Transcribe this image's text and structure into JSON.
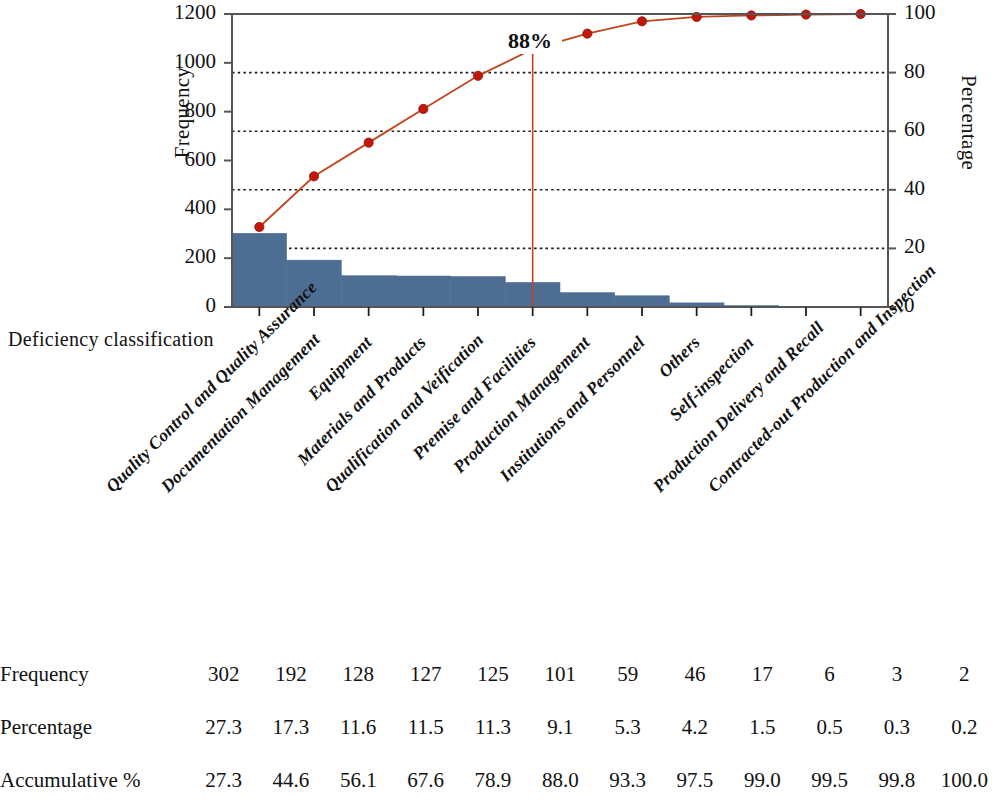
{
  "chart_data": {
    "type": "bar",
    "title": "",
    "subtitle": "",
    "xlabel": "Deficiency classification",
    "ylabel": "Frequency",
    "y2label": "Percentage",
    "ylim": [
      0,
      1200
    ],
    "y2lim": [
      0,
      100
    ],
    "yticks": [
      "0",
      "200",
      "400",
      "600",
      "800",
      "1000",
      "1200"
    ],
    "ytick_values": [
      0,
      200,
      400,
      600,
      800,
      1000,
      1200
    ],
    "y2ticks": [
      "0",
      "20",
      "40",
      "60",
      "80",
      "100"
    ],
    "y2tick_values": [
      0,
      20,
      40,
      60,
      80,
      100
    ],
    "grid": "horizontal-dotted-on-right-axis",
    "legend": "none",
    "categories": [
      "Quality Control and Quality Assurance",
      "Documentation Management",
      "Equipment",
      "Materials and Products",
      "Qualification and Veification",
      "Premise and Facilities",
      "Production Management",
      "Institutions and Personnel",
      "Others",
      "Self-inspection",
      "Production Delivery and Recall",
      "Contracted-out Production and Inspection"
    ],
    "series": [
      {
        "name": "Frequency",
        "type": "bar",
        "axis": "left",
        "color": "#4d6d93",
        "values": [
          302,
          192,
          128,
          127,
          125,
          101,
          59,
          46,
          17,
          6,
          3,
          2
        ]
      },
      {
        "name": "Accumulative %",
        "type": "line",
        "axis": "right",
        "color": "#c0451f",
        "marker_color": "#c4170c",
        "values": [
          27.3,
          44.6,
          56.1,
          67.6,
          78.9,
          88.0,
          93.3,
          97.5,
          99.0,
          99.5,
          99.8,
          100.0
        ]
      }
    ],
    "annotations": [
      {
        "text": "88%",
        "category": "Premise and Facilities",
        "category_index": 5,
        "value": 88.0,
        "marker": "vertical-line"
      }
    ]
  },
  "table": {
    "rows": [
      {
        "label": "Frequency",
        "values": [
          "302",
          "192",
          "128",
          "127",
          "125",
          "101",
          "59",
          "46",
          "17",
          "6",
          "3",
          "2"
        ]
      },
      {
        "label": "Percentage",
        "values": [
          "27.3",
          "17.3",
          "11.6",
          "11.5",
          "11.3",
          "9.1",
          "5.3",
          "4.2",
          "1.5",
          "0.5",
          "0.3",
          "0.2"
        ]
      },
      {
        "label": "Accumulative %",
        "values": [
          "27.3",
          "44.6",
          "56.1",
          "67.6",
          "78.9",
          "88.0",
          "93.3",
          "97.5",
          "99.0",
          "99.5",
          "99.8",
          "100.0"
        ]
      }
    ]
  },
  "colors": {
    "bar": "#4d6d93",
    "line": "#c0451f",
    "marker": "#c4170c",
    "axis": "#555555",
    "grid": "#1a1a1a",
    "text": "#111111"
  }
}
